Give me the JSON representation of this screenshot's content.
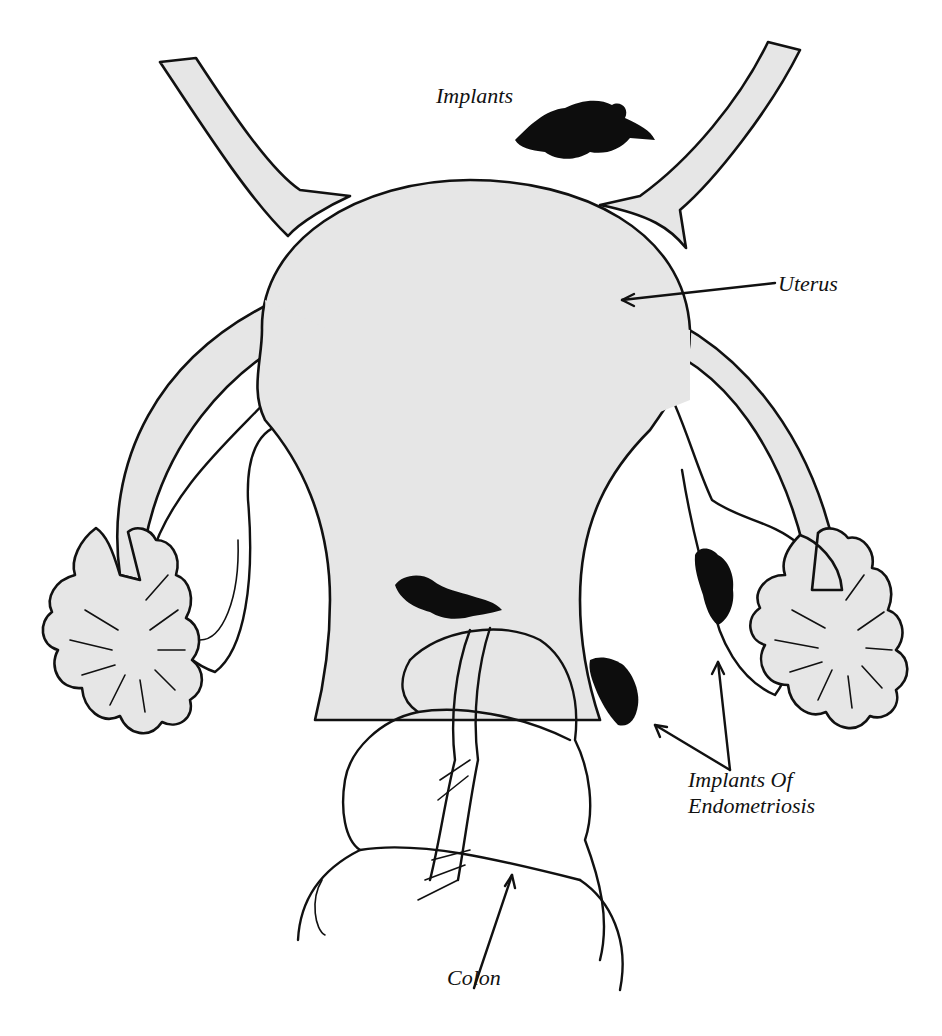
{
  "figure": {
    "type": "anatomical illustration",
    "colors": {
      "tissue_fill": "#e6e6e6",
      "ink": "#111111",
      "implant": "#0d0d0d",
      "background": "#ffffff"
    }
  },
  "labels": {
    "implants_top": "Implants",
    "uterus": "Uterus",
    "implants_of": "Implants Of",
    "endometriosis": "Endometriosis",
    "colon": "Colon"
  },
  "structures": [
    "uterus",
    "left-fallopian-tube",
    "right-fallopian-tube",
    "left-fimbriae",
    "right-fimbriae",
    "left-ovary",
    "right-ovary",
    "upper-ligaments",
    "colon",
    "endometriosis-implants"
  ]
}
